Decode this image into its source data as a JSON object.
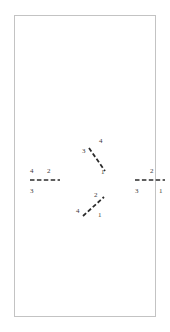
{
  "canvas": {
    "background_color": "#ffffff",
    "border_color": "#c3c3c3"
  },
  "figure": {
    "stroke_color": "#2b2b2b",
    "label_color": "#3a3a3a",
    "segments": [
      {
        "id": "left-horizontal",
        "orientation": "horizontal",
        "style": "dashed",
        "labels": {
          "top_left": "4",
          "top_right": "2",
          "bottom_left": "3"
        }
      },
      {
        "id": "right-horizontal",
        "orientation": "horizontal",
        "style": "dashed",
        "labels": {
          "top_center": "2",
          "bottom_left": "3",
          "bottom_right": "1"
        }
      },
      {
        "id": "upper-diagonal",
        "orientation": "diagonal-backslash",
        "style": "dashed",
        "labels": {
          "top_right": "4",
          "top_left": "3",
          "bottom_right": "1"
        }
      },
      {
        "id": "lower-diagonal",
        "orientation": "diagonal-slash",
        "style": "dashed",
        "labels": {
          "top_right": "2",
          "bottom_left": "4",
          "bottom_right": "1"
        }
      }
    ]
  }
}
